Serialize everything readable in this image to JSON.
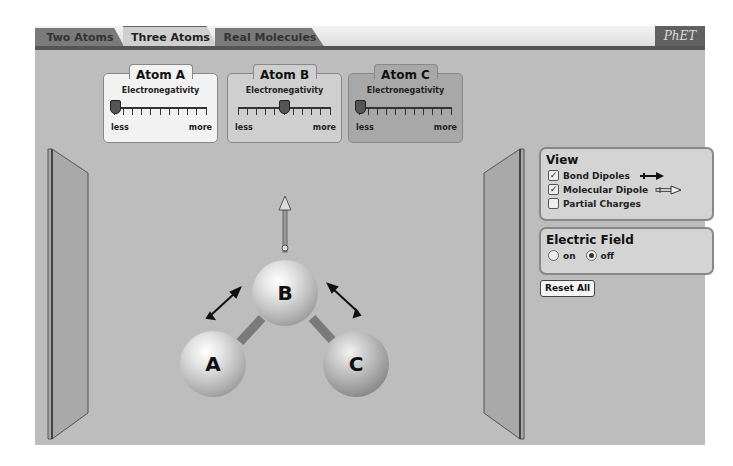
{
  "tabs": [
    {
      "label": "Two Atoms",
      "active": false
    },
    {
      "label": "Three Atoms",
      "active": true
    },
    {
      "label": "Real Molecules",
      "active": false
    }
  ],
  "logo": {
    "text": "PhET"
  },
  "atom_controls": [
    {
      "title": "Atom A",
      "subtitle": "Electronegativity",
      "min_label": "less",
      "max_label": "more",
      "slider_position": 0.0,
      "bg": "#f2f2f2"
    },
    {
      "title": "Atom B",
      "subtitle": "Electronegativity",
      "min_label": "less",
      "max_label": "more",
      "slider_position": 0.5,
      "bg": "#cfcfcf"
    },
    {
      "title": "Atom C",
      "subtitle": "Electronegativity",
      "min_label": "less",
      "max_label": "more",
      "slider_position": 0.0,
      "bg": "#a8a8a8"
    }
  ],
  "view_panel": {
    "title": "View",
    "options": [
      {
        "label": "Bond Dipoles",
        "checked": true,
        "icon": "bond-dipole-arrow-icon"
      },
      {
        "label": "Molecular Dipole",
        "checked": true,
        "icon": "molecular-dipole-arrow-icon"
      },
      {
        "label": "Partial Charges",
        "checked": false
      }
    ]
  },
  "electric_field_panel": {
    "title": "Electric Field",
    "options": [
      {
        "label": "on",
        "selected": false
      },
      {
        "label": "off",
        "selected": true
      }
    ]
  },
  "reset_button": {
    "label": "Reset All"
  },
  "molecule": {
    "atoms": [
      {
        "label": "A"
      },
      {
        "label": "B"
      },
      {
        "label": "C"
      }
    ]
  }
}
